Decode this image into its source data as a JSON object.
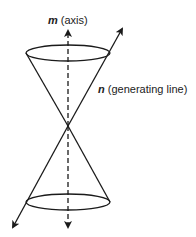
{
  "diagram": {
    "type": "double-cone",
    "labels": {
      "axis": {
        "var": "m",
        "desc": "(axis)"
      },
      "generating_line": {
        "var": "n",
        "desc": "(generating line)"
      }
    },
    "geometry": {
      "apex": [
        68,
        126
      ],
      "top_ellipse": {
        "cx": 68,
        "cy": 53,
        "rx": 42,
        "ry": 8
      },
      "bottom_ellipse": {
        "cx": 68,
        "cy": 202,
        "rx": 42,
        "ry": 8
      },
      "axis": {
        "from": [
          68,
          228
        ],
        "to": [
          68,
          30
        ],
        "style": "dashed",
        "arrows": "both"
      },
      "generating_line": {
        "from": [
          12,
          228
        ],
        "to": [
          122,
          28
        ],
        "arrows": "both"
      }
    },
    "colors": {
      "stroke": "#1a1a1a",
      "background": "#ffffff"
    }
  }
}
